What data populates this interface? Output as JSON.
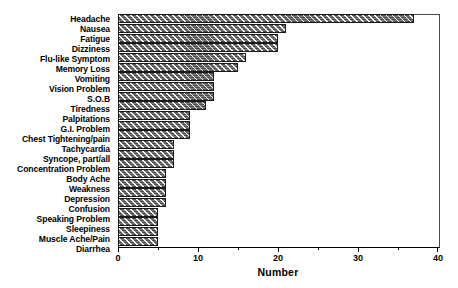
{
  "chart_data": {
    "type": "bar",
    "orientation": "horizontal",
    "title": "",
    "xlabel": "Number",
    "ylabel": "",
    "xlim": [
      0,
      40
    ],
    "ylim": null,
    "grid": false,
    "legend": null,
    "x_ticks": [
      0,
      10,
      20,
      30,
      40
    ],
    "x_minor_ticks": [
      5,
      15,
      25,
      35
    ],
    "categories": [
      "Headache",
      "Nausea",
      "Fatigue",
      "Dizziness",
      "Flu-like Symptom",
      "Memory Loss",
      "Vomiting",
      "Vision Problem",
      "S.O.B",
      "Tiredness",
      "Palpitations",
      "G.I. Problem",
      "Chest Tightening/pain",
      "Tachycardia",
      "Syncope, part/all",
      "Concentration Problem",
      "Body Ache",
      "Weakness",
      "Depression",
      "Confusion",
      "Speaking Problem",
      "Sleepiness",
      "Muscle Ache/Pain",
      "Diarrhea"
    ],
    "values": [
      37,
      21,
      20,
      20,
      16,
      15,
      12,
      12,
      12,
      11,
      9,
      9,
      9,
      7,
      7,
      7,
      6,
      6,
      6,
      6,
      5,
      5,
      5,
      5
    ],
    "bar_style": {
      "fill_color": "#6f6f6f",
      "hatch": "diagonal-white",
      "edge_color": "#1a1a1a"
    }
  }
}
